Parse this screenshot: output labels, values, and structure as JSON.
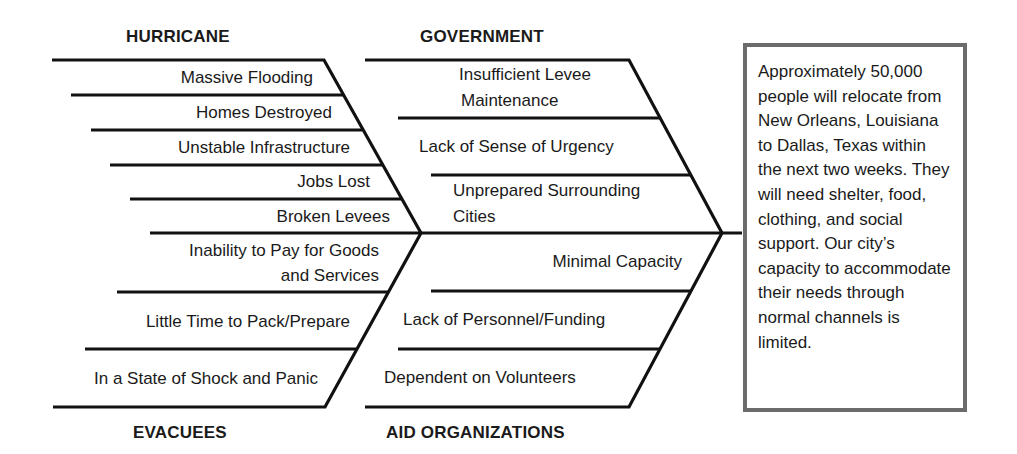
{
  "diagram": {
    "type": "fishbone",
    "categories": {
      "hurricane": {
        "title": "HURRICANE",
        "causes": [
          "Massive Flooding",
          "Homes Destroyed",
          "Unstable Infrastructure",
          "Jobs Lost",
          "Broken Levees"
        ]
      },
      "government": {
        "title": "GOVERNMENT",
        "causes": [
          "Insufficient Levee Maintenance",
          "Lack of Sense of Urgency",
          "Unprepared Surrounding Cities"
        ]
      },
      "evacuees": {
        "title": "EVACUEES",
        "causes": [
          "Inability to Pay for Goods and Services",
          "Little Time to Pack/Prepare",
          "In a State of Shock and Panic"
        ]
      },
      "aid_organizations": {
        "title": "AID ORGANIZATIONS",
        "causes": [
          "Minimal Capacity",
          "Lack of Personnel/Funding",
          "Dependent on Volunteers"
        ]
      }
    },
    "labels": {
      "gov_1a": "Insufficient Levee",
      "gov_1b": "Maintenance",
      "gov_3a": "Unprepared Surrounding",
      "gov_3b": "Cities",
      "eva_1a": "Inability to Pay for Goods",
      "eva_1b": "and Services"
    },
    "effect": "Approximately 50,000 people will relocate from New Orleans, Louisiana to Dallas, Texas within the next two weeks. They will need shelter, food, clothing, and social support. Our city’s capacity to accommodate their needs through normal channels is limited.",
    "colors": {
      "line": "#111111",
      "box_border": "#6b6b6b"
    }
  }
}
